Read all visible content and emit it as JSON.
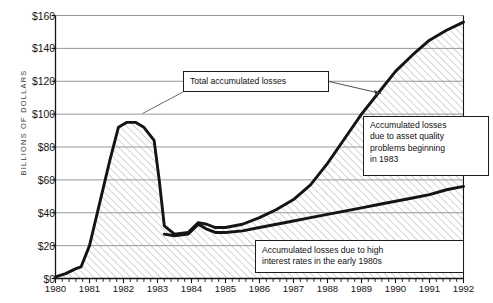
{
  "chart_data": {
    "type": "area",
    "title": "",
    "xlabel": "",
    "ylabel": "BILLIONS OF DOLLARS",
    "xlim": [
      1980,
      1992
    ],
    "ylim": [
      0,
      160
    ],
    "grid": true,
    "legend": "none",
    "x_tick_labels": [
      "1980",
      "1981",
      "1982",
      "1983",
      "1984",
      "1985",
      "1986",
      "1987",
      "1988",
      "1989",
      "1990",
      "1991",
      "1992"
    ],
    "y_tick_labels": [
      "$0",
      "$20",
      "$40",
      "$60",
      "$80",
      "$100",
      "$120",
      "$140",
      "$160"
    ],
    "y_tick_values": [
      0,
      20,
      40,
      60,
      80,
      100,
      120,
      140,
      160
    ],
    "minor_x_ticks_per_year": 4,
    "series": [
      {
        "name": "Total accumulated losses",
        "x": [
          1980.0,
          1980.3,
          1980.6,
          1980.75,
          1981.0,
          1981.3,
          1981.6,
          1981.85,
          1982.1,
          1982.35,
          1982.6,
          1982.75,
          1982.9,
          1983.05,
          1983.2,
          1983.5,
          1983.9,
          1984.2,
          1984.45,
          1984.7,
          1985.0,
          1985.5,
          1986.0,
          1986.5,
          1987.0,
          1987.5,
          1988.0,
          1988.5,
          1989.0,
          1989.5,
          1990.0,
          1990.5,
          1991.0,
          1991.5,
          1992.0
        ],
        "y": [
          1,
          3,
          6,
          7,
          20,
          46,
          72,
          92,
          95,
          95,
          92,
          88,
          84,
          60,
          32,
          27,
          28,
          34,
          33,
          31,
          31,
          33,
          37,
          42,
          48,
          57,
          70,
          85,
          100,
          113,
          126,
          136,
          145,
          151,
          156
        ]
      },
      {
        "name": "Accumulated losses due to high interest rates in the early 1980s",
        "x": [
          1983.2,
          1983.5,
          1983.9,
          1984.2,
          1984.45,
          1984.7,
          1985.0,
          1985.5,
          1986.0,
          1986.5,
          1987.0,
          1987.5,
          1988.0,
          1988.5,
          1989.0,
          1989.5,
          1990.0,
          1990.5,
          1991.0,
          1991.5,
          1992.0
        ],
        "y": [
          27,
          26,
          27,
          33,
          30,
          28,
          28,
          29,
          31,
          33,
          35,
          37,
          39,
          41,
          43,
          45,
          47,
          49,
          51,
          54,
          56
        ]
      }
    ],
    "annotations": [
      {
        "id": "total",
        "lines": [
          "Total accumulated losses"
        ],
        "points_to": "peak of total curve near 1982"
      },
      {
        "id": "asset-quality",
        "lines": [
          "Accumulated losses",
          "due to asset quality",
          "problems beginning",
          "in 1983"
        ],
        "points_to": "total curve near 1988"
      },
      {
        "id": "interest-rates",
        "lines": [
          "Accumulated losses due to high",
          "interest rates in the early 1980s"
        ],
        "points_to": "lower band"
      }
    ],
    "colors": {
      "line": "#141414",
      "gridline": "#8c8c8c",
      "hatch": "#9a9a9a",
      "fill": "#ffffff",
      "text": "#141414",
      "axis_label": "#3b3b3b"
    }
  }
}
